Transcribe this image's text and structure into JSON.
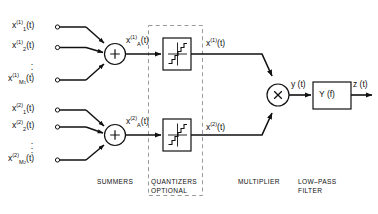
{
  "diagram": {
    "colors": {
      "line": "#111111",
      "dashed": "#999999",
      "background": "#ffffff"
    },
    "group1": {
      "inputs": [
        {
          "base": "x",
          "sub": "1",
          "sup": "(1)",
          "arg": "(t)"
        },
        {
          "base": "x",
          "sub": "2",
          "sup": "(1)",
          "arg": "(t)"
        },
        {
          "base": "x",
          "sub": "M",
          "subsub": "1",
          "sup": "(1)",
          "arg": "(t)"
        }
      ],
      "vertical_dots": "⋮",
      "summer_symbol": "+",
      "summer_output": {
        "base": "x",
        "sub": "A",
        "sup": "(1)",
        "arg": "(t)"
      },
      "quantizer_output": {
        "base": "x",
        "sup": "(1)",
        "arg": "(t)"
      }
    },
    "group2": {
      "inputs": [
        {
          "base": "x",
          "sub": "1",
          "sup": "(2)",
          "arg": "(t)"
        },
        {
          "base": "x",
          "sub": "2",
          "sup": "(2)",
          "arg": "(t)"
        },
        {
          "base": "x",
          "sub": "M",
          "subsub": "2",
          "sup": "(2)",
          "arg": "(t)"
        }
      ],
      "vertical_dots": "⋮",
      "summer_symbol": "+",
      "summer_output": {
        "base": "x",
        "sub": "A",
        "sup": "(2)",
        "arg": "(t)"
      },
      "quantizer_output": {
        "base": "x",
        "sup": "(2)",
        "arg": "(t)"
      }
    },
    "multiplier": {
      "symbol": "×",
      "output": "y (t)"
    },
    "filter": {
      "label": "Y (f)",
      "output": "z (t)"
    },
    "captions": {
      "summers": "SUMMERS",
      "quantizers_line1": "QUANTIZERS",
      "quantizers_line2": "OPTIONAL",
      "multiplier": "MULTIPLIER",
      "lowpass_line1": "LOW–PASS",
      "lowpass_line2": "FILTER"
    }
  }
}
